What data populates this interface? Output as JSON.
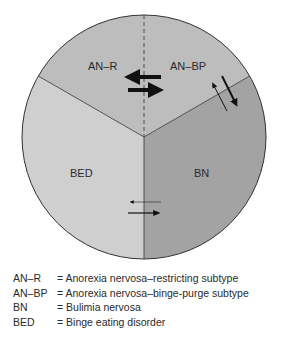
{
  "diagram": {
    "segments": [
      {
        "id": "an-r",
        "label": "AN–R",
        "color": "#bcbcbc"
      },
      {
        "id": "an-bp",
        "label": "AN–BP",
        "color": "#bcbcbc"
      },
      {
        "id": "bn",
        "label": "BN",
        "color": "#a2a2a2"
      },
      {
        "id": "bed",
        "label": "BED",
        "color": "#cfcfcf"
      }
    ],
    "transitions": [
      {
        "between": [
          "AN-R",
          "AN-BP"
        ],
        "style": "thick bidirectional"
      },
      {
        "between": [
          "AN-BP",
          "BN"
        ],
        "style": "bidirectional, thicker toward BN"
      },
      {
        "between": [
          "BED",
          "BN"
        ],
        "style": "thin bidirectional, stronger toward BN"
      }
    ]
  },
  "legend": [
    {
      "abbr": "AN–R",
      "definition": "= Anorexia nervosa–restricting subtype"
    },
    {
      "abbr": "AN–BP",
      "definition": "= Anorexia nervosa–binge-purge subtype"
    },
    {
      "abbr": "BN",
      "definition": "= Bulimia nervosa"
    },
    {
      "abbr": "BED",
      "definition": "= Binge eating disorder"
    }
  ]
}
